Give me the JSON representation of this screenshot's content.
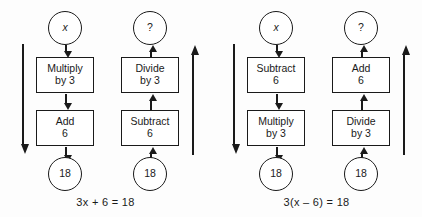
{
  "figure": {
    "ink_color": "#1a1a1a",
    "background_color": "#fdfdfd"
  },
  "diagrams": [
    {
      "id": "diagram-left",
      "caption": "3x + 6 = 18",
      "forward": {
        "start_node": "x",
        "steps": [
          {
            "line1": "Multiply",
            "line2": "by 3"
          },
          {
            "line1": "Add",
            "line2": "6"
          }
        ],
        "end_node": "18",
        "rail_direction": "down"
      },
      "inverse": {
        "start_node": "18",
        "steps": [
          {
            "line1": "Divide",
            "line2": "by 3"
          },
          {
            "line1": "Subtract",
            "line2": "6"
          }
        ],
        "end_node": "?",
        "rail_direction": "up"
      }
    },
    {
      "id": "diagram-right",
      "caption": "3(x – 6) = 18",
      "forward": {
        "start_node": "x",
        "steps": [
          {
            "line1": "Subtract",
            "line2": "6"
          },
          {
            "line1": "Multiply",
            "line2": "by 3"
          }
        ],
        "end_node": "18",
        "rail_direction": "down"
      },
      "inverse": {
        "start_node": "18",
        "steps": [
          {
            "line1": "Add",
            "line2": "6"
          },
          {
            "line1": "Divide",
            "line2": "by 3"
          }
        ],
        "end_node": "?",
        "rail_direction": "up"
      }
    }
  ]
}
